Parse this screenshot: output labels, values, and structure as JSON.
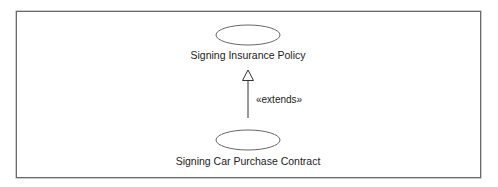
{
  "diagram": {
    "type": "uml-use-case",
    "use_cases": [
      {
        "id": "insurance",
        "label": "Signing Insurance Policy",
        "cx": 248,
        "cy": 35,
        "rx": 32,
        "ry": 10,
        "label_x": 248,
        "label_y": 49
      },
      {
        "id": "car",
        "label": "Signing Car Purchase Contract",
        "cx": 248,
        "cy": 140,
        "rx": 32,
        "ry": 10,
        "label_x": 248,
        "label_y": 155
      }
    ],
    "relationships": [
      {
        "from": "car",
        "to": "insurance",
        "kind": "extend",
        "stereotype": "«extends»",
        "label_x": 256,
        "label_y": 94
      }
    ],
    "colors": {
      "stroke": "#555555",
      "frame": "#6a6a6a",
      "text": "#222222",
      "background": "#ffffff"
    }
  }
}
